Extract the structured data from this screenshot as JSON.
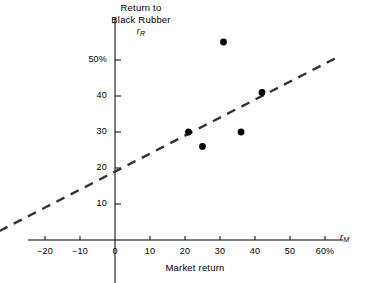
{
  "figure": {
    "y_axis_title_line1": "Return to",
    "y_axis_title_line2": "Black Rubber",
    "y_axis_symbol_base": "r",
    "y_axis_symbol_sub": "R",
    "x_axis_symbol_base": "r",
    "x_axis_symbol_sub": "M",
    "x_axis_title": "Market return"
  },
  "chart_data": {
    "type": "scatter",
    "title": "",
    "xlabel": "Market return",
    "ylabel": "Return to Black Rubber",
    "x_symbol": "rM",
    "y_symbol": "rR",
    "xlim": [
      -26,
      66
    ],
    "ylim": [
      0,
      60
    ],
    "grid": false,
    "legend": "none",
    "xticks": [
      -20,
      -10,
      0,
      10,
      20,
      30,
      40,
      50,
      60
    ],
    "xticklabels": [
      "−20",
      "−10",
      "0",
      "10",
      "20",
      "30",
      "40",
      "50",
      "60%"
    ],
    "yticks": [
      10,
      20,
      30,
      40,
      50
    ],
    "yticklabels": [
      "10",
      "20",
      "30",
      "40",
      "50%"
    ],
    "points": [
      {
        "x": 31,
        "y": 55
      },
      {
        "x": 42,
        "y": 41
      },
      {
        "x": 21,
        "y": 30
      },
      {
        "x": 36,
        "y": 30
      },
      {
        "x": 25,
        "y": 26
      }
    ],
    "fit_line": {
      "style": "dashed",
      "intercept": 19,
      "slope": 0.5,
      "x_start": -33,
      "x_end": 63,
      "y_start": 2.5,
      "y_end": 50.5
    },
    "colors": {
      "axis": "#000000",
      "point": "#000000",
      "fit_line": "#333333"
    }
  }
}
